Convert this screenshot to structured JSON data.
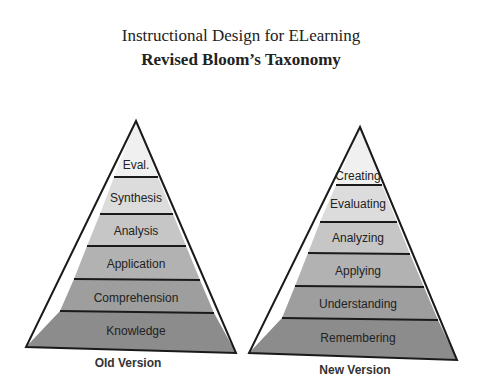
{
  "header": {
    "title": "Instructional Design for ELearning",
    "subtitle": "Revised Bloom’s Taxonomy"
  },
  "pyramids": [
    {
      "caption": "Old Version",
      "layers_top_to_bottom": [
        "Eval.",
        "Synthesis",
        "Analysis",
        "Application",
        "Comprehension",
        "Knowledge"
      ]
    },
    {
      "caption": "New Version",
      "layers_top_to_bottom": [
        "Creating",
        "Evaluating",
        "Analyzing",
        "Applying",
        "Understanding",
        "Remembering"
      ]
    }
  ],
  "colors": {
    "outline": "#1a1a1a",
    "fill_top": "#f2f2f2",
    "fill_bottom": "#8a8a8a"
  }
}
